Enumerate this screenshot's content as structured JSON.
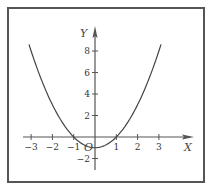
{
  "chart_data": {
    "type": "line",
    "title": "",
    "function": "y = x^2 - 1",
    "xlabel": "X",
    "ylabel": "Y",
    "origin_label": "O",
    "xlim": [
      -3.5,
      4
    ],
    "ylim": [
      -3,
      9.5
    ],
    "x_ticks": [
      -3,
      -2,
      -1,
      1,
      2,
      3
    ],
    "x_tick_labels": [
      "-3",
      "-2",
      "-1",
      "1",
      "2",
      "3"
    ],
    "y_ticks": [
      8,
      6,
      4,
      2,
      -2
    ],
    "y_tick_labels": [
      "8",
      "6",
      "4",
      "2",
      "-2"
    ],
    "grid": false,
    "series": [
      {
        "name": "parabola",
        "x": [
          -3.1,
          -3,
          -2.5,
          -2,
          -1.5,
          -1,
          -0.5,
          0,
          0.5,
          1,
          1.5,
          2,
          2.5,
          3,
          3.1
        ],
        "y": [
          8.61,
          8,
          5.25,
          3,
          1.25,
          0,
          -0.75,
          -1,
          -0.75,
          0,
          1.25,
          3,
          5.25,
          8,
          8.61
        ]
      }
    ],
    "colors": {
      "line": "#444444",
      "axis": "#555555",
      "frame": "#555555"
    }
  }
}
